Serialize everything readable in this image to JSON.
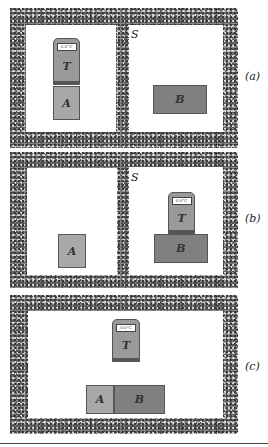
{
  "panels": [
    {
      "label": "(a)",
      "room_label": "S",
      "thermometer": {
        "label": "T",
        "display": "0.0°C"
      },
      "blocks": [
        {
          "label": "A"
        },
        {
          "label": "B"
        }
      ]
    },
    {
      "label": "(b)",
      "room_label": "S",
      "thermometer": {
        "label": "T",
        "display": "0.0°C"
      },
      "blocks": [
        {
          "label": "A"
        },
        {
          "label": "B"
        }
      ]
    },
    {
      "label": "(c)",
      "thermometer": {
        "label": "T",
        "display": "0.0°C"
      },
      "blocks": [
        {
          "label": "A"
        },
        {
          "label": "B"
        }
      ]
    }
  ],
  "colors": {
    "block_a": "#a8a8a8",
    "block_b": "#808080",
    "thermometer": "#9a9a9a",
    "wall": "#8a8a8a"
  }
}
